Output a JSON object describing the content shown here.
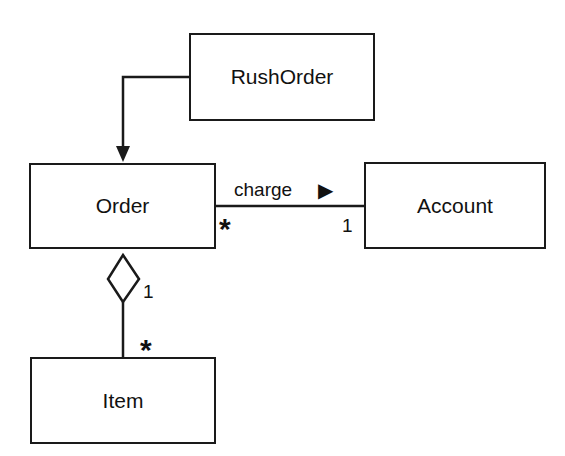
{
  "diagram": {
    "type": "UML class diagram",
    "classes": [
      {
        "id": "rushorder",
        "name": "RushOrder"
      },
      {
        "id": "order",
        "name": "Order"
      },
      {
        "id": "account",
        "name": "Account"
      },
      {
        "id": "item",
        "name": "Item"
      }
    ],
    "relationships": [
      {
        "type": "directed",
        "from": "RushOrder",
        "to": "Order"
      },
      {
        "type": "association",
        "from": "Order",
        "to": "Account",
        "label": "charge",
        "label_arrow": "▶",
        "from_multiplicity": "*",
        "to_multiplicity": "1"
      },
      {
        "type": "aggregation",
        "whole": "Order",
        "part": "Item",
        "whole_multiplicity": "1",
        "part_multiplicity": "*"
      }
    ]
  },
  "labels": {
    "rushorder": "RushOrder",
    "order": "Order",
    "account": "Account",
    "item": "Item",
    "charge": "charge",
    "charge_arrow": "▶",
    "order_account_mult": "*",
    "account_mult": "1",
    "order_agg_mult": "1",
    "item_mult": "*"
  }
}
